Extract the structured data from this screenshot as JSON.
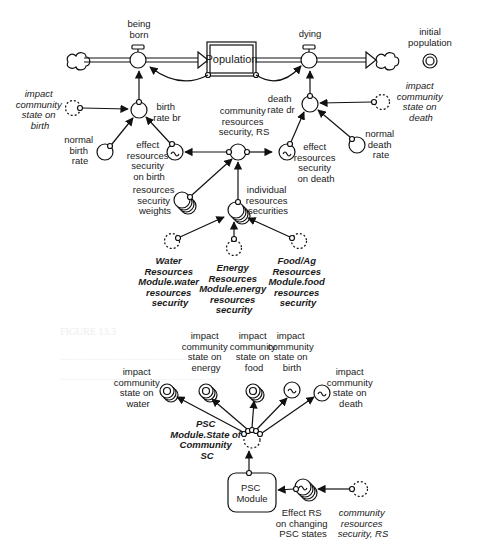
{
  "diagram": {
    "stock": {
      "label": "Population"
    },
    "flows": [
      {
        "id": "being-born",
        "label": "being born"
      },
      {
        "id": "dying",
        "label": "dying"
      }
    ],
    "standalone": {
      "initial_population": "initial population"
    },
    "top_section": {
      "impact_birth": [
        "impact",
        "community",
        "state on",
        "birth"
      ],
      "birth_rate": [
        "birth",
        "rate br"
      ],
      "normal_birth_rate": [
        "normal",
        "birth",
        "rate"
      ],
      "effect_birth": [
        "effect",
        "resources",
        "security",
        "on birth"
      ],
      "crs": [
        "community",
        "resources",
        "security, RS"
      ],
      "death_rate": [
        "death",
        "rate dr"
      ],
      "impact_death": [
        "impact",
        "community",
        "state on",
        "death"
      ],
      "effect_death": [
        "effect",
        "resources",
        "security",
        "on death"
      ],
      "normal_death_rate": [
        "normal",
        "death",
        "rate"
      ],
      "weights": [
        "resources",
        "security",
        "weights"
      ],
      "individual": [
        "individual",
        "resources",
        "securities"
      ],
      "water": [
        "Water",
        "Resources",
        "Module.water",
        "resources",
        "security"
      ],
      "energy": [
        "Energy",
        "Resources",
        "Module.energy",
        "resources",
        "security"
      ],
      "food": [
        "Food/Ag",
        "Resources",
        "Module.food",
        "resources",
        "security"
      ]
    },
    "bottom_section": {
      "impact_water": [
        "impact",
        "community",
        "state on",
        "water"
      ],
      "impact_energy": [
        "impact",
        "community",
        "state on",
        "energy"
      ],
      "impact_food": [
        "impact",
        "community",
        "state on",
        "food"
      ],
      "impact_birth": [
        "impact",
        "community",
        "state on",
        "birth"
      ],
      "impact_death": [
        "impact",
        "community",
        "state on",
        "death"
      ],
      "psc_state": [
        "PSC",
        "Module.State of",
        "Community",
        "SC"
      ],
      "psc_module": [
        "PSC",
        "Module"
      ],
      "effect_rs": [
        "Effect RS",
        "on changing",
        "PSC states"
      ],
      "community_rs": [
        "community",
        "resources",
        "security, RS"
      ]
    },
    "colors": {
      "line": "#111111",
      "background": "#ffffff",
      "text": "#1a1a1a"
    }
  }
}
